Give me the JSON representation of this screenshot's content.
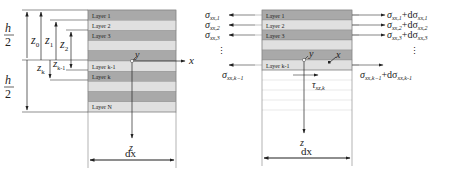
{
  "figure": {
    "left_panel": {
      "layers": [
        {
          "label": "Layer 1",
          "shade": "dark"
        },
        {
          "label": "Layer 2",
          "shade": "light"
        },
        {
          "label": "Layer 3",
          "shade": "dark"
        },
        {
          "label": "",
          "shade": "light"
        },
        {
          "label": "",
          "shade": "dark"
        },
        {
          "label": "Layer k-1",
          "shade": "light"
        },
        {
          "label": "Layer k",
          "shade": "dark"
        },
        {
          "label": "",
          "shade": "light"
        },
        {
          "label": "",
          "shade": "dark"
        },
        {
          "label": "Layer N",
          "shade": "light"
        }
      ],
      "dims": {
        "h_half_top": {
          "num": "h",
          "den": "2"
        },
        "h_half_bottom": {
          "num": "h",
          "den": "2"
        },
        "z0": {
          "base": "z",
          "sub": "0"
        },
        "z1": {
          "base": "z",
          "sub": "1"
        },
        "z2": {
          "base": "z",
          "sub": "2"
        },
        "zk": {
          "base": "z",
          "sub": "k"
        },
        "zk_1": {
          "base": "z",
          "sub": "k-1"
        }
      },
      "axes": {
        "x": "x",
        "y": "y",
        "z": "z"
      },
      "width_label": "dx"
    },
    "right_panel": {
      "layers": [
        {
          "label": "Layer 1",
          "shade": "dark"
        },
        {
          "label": "Layer 2",
          "shade": "light"
        },
        {
          "label": "Layer 3",
          "shade": "dark"
        },
        {
          "label": "",
          "shade": "light"
        },
        {
          "label": "",
          "shade": "dark"
        },
        {
          "label": "Layer k-1",
          "shade": "light"
        }
      ],
      "left_stresses": [
        {
          "base": "σ",
          "sub": "xx,1"
        },
        {
          "base": "σ",
          "sub": "xx,2"
        },
        {
          "base": "σ",
          "sub": "xx,3"
        },
        {
          "base": "σ",
          "sub": "xx,k−1"
        }
      ],
      "right_stresses": [
        {
          "base": "σ",
          "sub": "xx,1",
          "plus": "+dσ",
          "sub2": "xx,1"
        },
        {
          "base": "σ",
          "sub": "xx,2",
          "plus": "+dσ",
          "sub2": "xx,2"
        },
        {
          "base": "σ",
          "sub": "xx,3",
          "plus": "+dσ",
          "sub2": "xx,3"
        },
        {
          "base": "σ",
          "sub": "xx,k−1",
          "plus": "+dσ",
          "sub2": "xx,k-1"
        }
      ],
      "shear": {
        "base": "τ",
        "sub": "xz,k"
      },
      "ellipsis": "⋮",
      "axes": {
        "x": "x",
        "y": "y",
        "z": "z"
      },
      "width_label": "dx"
    },
    "colors": {
      "dark_layer": "#a9a9a9",
      "light_layer": "#e0e0e0",
      "line": "#333333",
      "faint_line": "#cfcfcf"
    }
  }
}
